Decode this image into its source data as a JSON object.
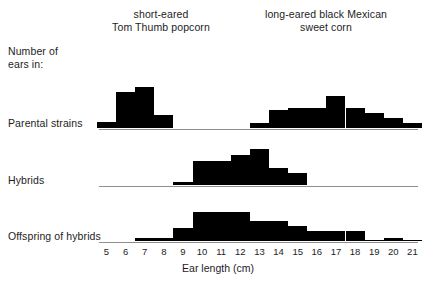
{
  "figure": {
    "title_left": "short-eared\nTom Thumb popcorn",
    "title_right": "long-eared black Mexican\nsweet corn",
    "y_caption": "Number of\nears in:",
    "row_labels": {
      "parental": "Parental strains",
      "hybrids": "Hybrids",
      "offspring": "Offspring of hybrids"
    },
    "x_axis_title": "Ear length (cm)",
    "colors": {
      "bar_fill": "#000000",
      "axis_line": "#8e8e8e",
      "text": "#1d1d1d",
      "background": "#ffffff"
    }
  },
  "chart_data": {
    "type": "bar",
    "xlabel": "Ear length (cm)",
    "ylabel": "Number of ears in:",
    "xlim": [
      4.5,
      21.5
    ],
    "grid": false,
    "legend": "none",
    "annotations": [
      "short-eared\nTom Thumb popcorn",
      "long-eared black Mexican\nsweet corn"
    ],
    "categories": [
      5,
      6,
      7,
      8,
      9,
      10,
      11,
      12,
      13,
      14,
      15,
      16,
      17,
      18,
      19,
      20,
      21
    ],
    "tick_labels": [
      "5",
      "6",
      "7",
      "8",
      "9",
      "10",
      "11",
      "12",
      "13",
      "14",
      "15",
      "16",
      "17",
      "18",
      "19",
      "20",
      "21"
    ],
    "panels": [
      {
        "name": "Parental strains",
        "row_label": "Parental strains",
        "series": [
          {
            "name": "short-eared Tom Thumb popcorn",
            "x": [
              5,
              6,
              7,
              8
            ],
            "values": [
              4,
              21,
              24,
              8
            ]
          },
          {
            "name": "long-eared black Mexican sweet corn",
            "x": [
              13,
              14,
              15,
              16,
              17,
              18,
              19,
              20,
              21
            ],
            "values": [
              3,
              11,
              12,
              12,
              19,
              12,
              9,
              6,
              3
            ]
          }
        ]
      },
      {
        "name": "Hybrids",
        "row_label": "Hybrids",
        "series": [
          {
            "name": "F1 hybrids",
            "x": [
              9,
              10,
              11,
              12,
              13,
              14,
              15
            ],
            "values": [
              2,
              14,
              14,
              18,
              21,
              10,
              7
            ]
          }
        ]
      },
      {
        "name": "Offspring of hybrids",
        "row_label": "Offspring of hybrids",
        "series": [
          {
            "name": "F2 offspring",
            "x": [
              7,
              8,
              9,
              10,
              11,
              12,
              13,
              14,
              15,
              16,
              17,
              18,
              19,
              20,
              21
            ],
            "values": [
              2,
              2,
              8,
              17,
              17,
              17,
              12,
              12,
              9,
              6,
              6,
              6,
              1,
              2,
              1
            ]
          }
        ]
      }
    ]
  }
}
